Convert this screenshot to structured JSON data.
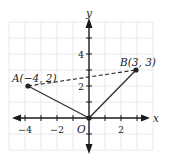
{
  "diagram": {
    "type": "coordinate-plane",
    "axes": {
      "x_label": "x",
      "y_label": "y",
      "origin_label": "O",
      "x_tick_labels": [
        "−4",
        "−2",
        "2"
      ],
      "y_tick_labels": [
        "2",
        "4"
      ]
    },
    "points": [
      {
        "name": "A",
        "label": "A(−4, 2)",
        "x": -4,
        "y": 2
      },
      {
        "name": "B",
        "label": "B(3, 3)",
        "x": 3,
        "y": 3
      },
      {
        "name": "O",
        "label": "O",
        "x": 0,
        "y": 0
      }
    ],
    "segments": [
      {
        "from": "A",
        "to": "O",
        "style": "solid"
      },
      {
        "from": "O",
        "to": "B",
        "style": "solid"
      },
      {
        "from": "A",
        "to": "B",
        "style": "dashed"
      }
    ],
    "grid": {
      "x_range": [
        -5,
        4
      ],
      "y_range": [
        -2,
        6
      ],
      "step": 1
    }
  }
}
